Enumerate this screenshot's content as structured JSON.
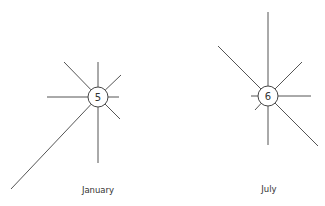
{
  "diagram": {
    "type": "wind-rose",
    "colors": {
      "line": "#555555",
      "text": "#333333",
      "background": "#ffffff"
    },
    "roses": [
      {
        "label": "January",
        "calm_value": "5",
        "center": [
          98,
          97
        ],
        "hub_radius": 10,
        "label_pos": [
          98,
          193
        ],
        "rays": [
          {
            "dir": "N",
            "end": [
              98,
              62
            ]
          },
          {
            "dir": "NE",
            "end": [
              121,
              75
            ]
          },
          {
            "dir": "E",
            "end": [
              119,
              97
            ]
          },
          {
            "dir": "SE",
            "end": [
              120,
              119
            ]
          },
          {
            "dir": "S",
            "end": [
              98,
              163
            ]
          },
          {
            "dir": "SW",
            "end": [
              11,
              189
            ]
          },
          {
            "dir": "W",
            "end": [
              47,
              97
            ]
          },
          {
            "dir": "NW",
            "end": [
              64,
              62
            ]
          }
        ]
      },
      {
        "label": "July",
        "calm_value": "6",
        "center": [
          268,
          96
        ],
        "hub_radius": 10,
        "label_pos": [
          269,
          192
        ],
        "rays": [
          {
            "dir": "N",
            "end": [
              268,
              12
            ]
          },
          {
            "dir": "NE",
            "end": [
              302,
              62
            ]
          },
          {
            "dir": "E",
            "end": [
              311,
              96
            ]
          },
          {
            "dir": "SE",
            "end": [
              318,
              146
            ]
          },
          {
            "dir": "S",
            "end": [
              268,
              145
            ]
          },
          {
            "dir": "SW",
            "end": [
              255,
              110
            ]
          },
          {
            "dir": "W",
            "end": [
              251,
              96
            ]
          },
          {
            "dir": "NW",
            "end": [
              218,
              46
            ]
          }
        ]
      }
    ]
  }
}
